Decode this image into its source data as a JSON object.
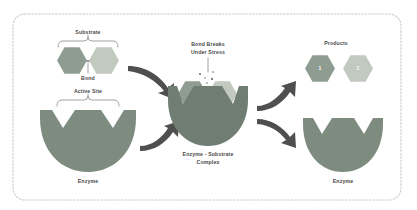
{
  "figure": {
    "border_style": "dashed-rounded",
    "background": "#ffffff"
  },
  "colors": {
    "hex_dark": "#8f9c91",
    "hex_light": "#c2cac0",
    "enzyme_dark": "#6f7d72",
    "enzyme_mid": "#7e8c80",
    "arrow": "#4f4f4f",
    "label_text": "#4a4a4a",
    "brace": "#8a8a8a",
    "frame": "#c9c9c9",
    "bond": "#6f6f6f",
    "spark": "#5a5a5a"
  },
  "labels": {
    "substrate": "Substrate",
    "bond": "Bond",
    "active_site": "Active Site",
    "enzyme_left": "Enzyme",
    "bond_breaks": "Bond Breaks",
    "under_stress": "Under Stress",
    "complex_line1": "Enzyme - Substrate",
    "complex_line2": "Complex",
    "products": "Products",
    "enzyme_right": "Enzyme"
  },
  "products": [
    {
      "id": "product-1",
      "label": "1",
      "fill": "#8f9c91"
    },
    {
      "id": "product-2",
      "label": "1",
      "fill": "#c2cac0"
    }
  ],
  "substrate_units": [
    {
      "id": "substrate-unit-left",
      "fill": "#8f9c91"
    },
    {
      "id": "substrate-unit-right",
      "fill": "#c2cac0"
    }
  ],
  "complex_units": [
    {
      "id": "complex-unit-left",
      "fill": "#8f9c91"
    },
    {
      "id": "complex-unit-right",
      "fill": "#c2cac0"
    }
  ],
  "arrows": [
    {
      "id": "arrow-substrate-to-complex",
      "direction": "down-right"
    },
    {
      "id": "arrow-enzyme-to-complex",
      "direction": "up-right"
    },
    {
      "id": "arrow-complex-to-products",
      "direction": "up-right"
    },
    {
      "id": "arrow-complex-to-enzyme",
      "direction": "down-right"
    }
  ],
  "sparks": [
    {
      "id": "spark-1"
    },
    {
      "id": "spark-2"
    },
    {
      "id": "spark-3"
    },
    {
      "id": "spark-4"
    },
    {
      "id": "spark-5"
    }
  ]
}
